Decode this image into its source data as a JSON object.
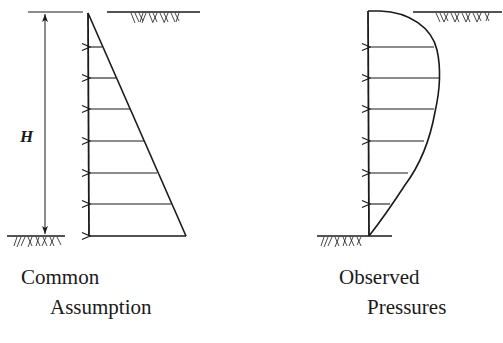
{
  "diagram": {
    "dimension_label": "H",
    "left_panel": {
      "caption_line1": "Common",
      "caption_line2": "Assumption",
      "shape": "triangular (linearly increasing with depth)",
      "arrow_count": 7
    },
    "right_panel": {
      "caption_line1": "Observed",
      "caption_line2": "Pressures",
      "shape": "curved (maximum near upper-middle, decreasing to zero at base)",
      "arrow_count": 6
    },
    "colors": {
      "ink": "#1a1a1a",
      "background": "#ffffff"
    }
  }
}
